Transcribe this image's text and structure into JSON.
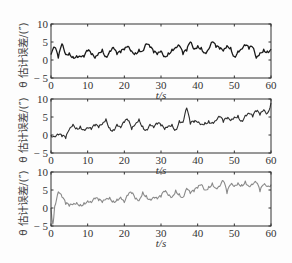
{
  "chart_data": [
    {
      "type": "line",
      "panel": "top",
      "title": "",
      "xlabel": "t/s",
      "ylabel": "θ 估计误差/(″)",
      "xlim": [
        0,
        60
      ],
      "ylim": [
        -5,
        10
      ],
      "xticks": [
        0,
        10,
        20,
        30,
        40,
        50,
        60
      ],
      "yticks": [
        -5,
        0,
        5,
        10
      ],
      "grid": false,
      "series": [
        {
          "name": "estimate error (black)",
          "color": "#1a1a1a",
          "x": [
            0,
            1,
            2,
            3,
            4,
            5,
            6,
            7,
            8,
            9,
            10,
            11,
            12,
            13,
            14,
            15,
            16,
            17,
            18,
            19,
            20,
            21,
            22,
            23,
            24,
            25,
            26,
            27,
            28,
            29,
            30,
            31,
            32,
            33,
            34,
            35,
            36,
            37,
            38,
            39,
            40,
            41,
            42,
            43,
            44,
            45,
            46,
            47,
            48,
            49,
            50,
            51,
            52,
            53,
            54,
            55,
            56,
            57,
            58,
            59,
            60
          ],
          "values": [
            1.5,
            3.5,
            0.5,
            4.5,
            1.5,
            2.0,
            1.0,
            1.2,
            1.0,
            0.8,
            2.5,
            1.5,
            0.5,
            2.0,
            3.0,
            1.0,
            2.5,
            3.5,
            1.5,
            2.0,
            2.8,
            3.8,
            2.5,
            2.0,
            3.0,
            2.5,
            4.5,
            3.5,
            2.0,
            1.5,
            2.5,
            1.0,
            2.0,
            3.0,
            3.5,
            4.0,
            1.5,
            2.5,
            5.0,
            3.0,
            4.0,
            3.5,
            2.0,
            3.0,
            5.0,
            3.5,
            3.0,
            2.5,
            4.0,
            3.5,
            1.0,
            2.5,
            3.0,
            4.0,
            3.0,
            3.5,
            0.5,
            2.0,
            3.0,
            2.5,
            3.0
          ]
        }
      ]
    },
    {
      "type": "line",
      "panel": "middle",
      "title": "",
      "xlabel": "t/s",
      "ylabel": "θ 估计误差/(″)",
      "xlim": [
        0,
        60
      ],
      "ylim": [
        -5,
        10
      ],
      "xticks": [
        0,
        10,
        20,
        30,
        40,
        50,
        60
      ],
      "yticks": [
        -5,
        0,
        5,
        10
      ],
      "grid": false,
      "series": [
        {
          "name": "estimate error (dark gray)",
          "color": "#2e2e2e",
          "x": [
            0,
            1,
            2,
            3,
            4,
            5,
            6,
            7,
            8,
            9,
            10,
            11,
            12,
            13,
            14,
            15,
            16,
            17,
            18,
            19,
            20,
            21,
            22,
            23,
            24,
            25,
            26,
            27,
            28,
            29,
            30,
            31,
            32,
            33,
            34,
            35,
            36,
            37,
            38,
            39,
            40,
            41,
            42,
            43,
            44,
            45,
            46,
            47,
            48,
            49,
            50,
            51,
            52,
            53,
            54,
            55,
            56,
            57,
            58,
            59,
            60
          ],
          "values": [
            0.0,
            -0.5,
            0.0,
            -0.5,
            -1.0,
            1.5,
            3.0,
            2.0,
            2.5,
            1.5,
            2.0,
            1.5,
            2.5,
            2.0,
            3.0,
            4.5,
            2.0,
            1.5,
            3.0,
            2.0,
            3.5,
            4.0,
            1.5,
            3.0,
            4.5,
            2.5,
            1.5,
            3.0,
            2.0,
            3.0,
            2.5,
            1.5,
            2.5,
            3.0,
            1.5,
            4.0,
            3.5,
            7.5,
            3.0,
            3.5,
            3.5,
            3.0,
            3.5,
            4.0,
            3.5,
            4.0,
            5.0,
            3.5,
            4.5,
            4.0,
            5.0,
            5.5,
            4.0,
            5.5,
            6.0,
            5.0,
            6.5,
            5.5,
            7.0,
            6.0,
            9.0
          ]
        }
      ]
    },
    {
      "type": "line",
      "panel": "bottom",
      "title": "",
      "xlabel": "t/s",
      "ylabel": "θ 估计误差/(″)",
      "xlim": [
        0,
        60
      ],
      "ylim": [
        -5,
        10
      ],
      "xticks": [
        0,
        10,
        20,
        30,
        40,
        50,
        60
      ],
      "yticks": [
        -5,
        0,
        5,
        10
      ],
      "grid": false,
      "series": [
        {
          "name": "estimate error (light gray)",
          "color": "#8a8a8a",
          "x": [
            0,
            0.5,
            1,
            2,
            3,
            4,
            5,
            6,
            7,
            8,
            9,
            10,
            11,
            12,
            13,
            14,
            15,
            16,
            17,
            18,
            19,
            20,
            21,
            22,
            23,
            24,
            25,
            26,
            27,
            28,
            29,
            30,
            31,
            32,
            33,
            34,
            35,
            36,
            37,
            38,
            39,
            40,
            41,
            42,
            43,
            44,
            45,
            46,
            47,
            48,
            49,
            50,
            51,
            52,
            53,
            54,
            55,
            56,
            57,
            58,
            59,
            60
          ],
          "values": [
            0.0,
            -4.5,
            0.5,
            4.5,
            3.0,
            1.0,
            0.5,
            1.0,
            1.5,
            1.0,
            1.5,
            2.0,
            1.5,
            2.5,
            2.0,
            1.5,
            2.5,
            3.0,
            2.0,
            2.5,
            3.0,
            1.5,
            3.5,
            4.0,
            2.5,
            2.0,
            4.5,
            3.5,
            2.5,
            3.0,
            2.5,
            3.0,
            4.5,
            3.5,
            3.0,
            5.0,
            4.0,
            3.0,
            5.5,
            4.0,
            4.5,
            5.5,
            6.5,
            5.0,
            6.0,
            7.0,
            5.5,
            6.0,
            7.5,
            4.0,
            6.5,
            6.0,
            7.0,
            6.5,
            7.5,
            6.0,
            6.5,
            7.0,
            4.5,
            6.5,
            6.0,
            6.5
          ]
        }
      ]
    }
  ],
  "labels": {
    "xaxis": "t/s",
    "yaxis": "θ 估计误差/(″)",
    "xticks": [
      "0",
      "10",
      "20",
      "30",
      "40",
      "50",
      "60"
    ],
    "yticks": [
      "10",
      "5",
      "0",
      "− 5"
    ]
  }
}
